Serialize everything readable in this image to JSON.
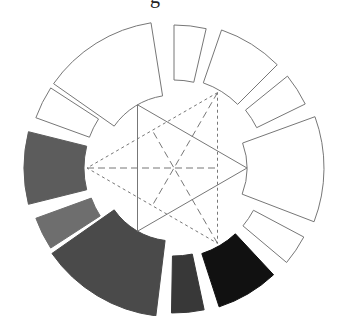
{
  "title_fragment": "g",
  "diagram": {
    "center": [
      174,
      168
    ],
    "stroke_color": "#777777",
    "segments": [
      {
        "name": "segment-top-narrow",
        "start": 77,
        "end": 90,
        "r_in": 88,
        "r_out": 143,
        "fill": "#ffffff"
      },
      {
        "name": "segment-upper-right",
        "start": 45,
        "end": 71,
        "r_in": 90,
        "r_out": 146,
        "fill": "#ffffff"
      },
      {
        "name": "segment-right-narrow",
        "start": 26,
        "end": 39,
        "r_in": 92,
        "r_out": 146,
        "fill": "#ffffff"
      },
      {
        "name": "segment-right-large",
        "start": -21,
        "end": 20,
        "r_in": 73,
        "r_out": 150,
        "fill": "#ffffff"
      },
      {
        "name": "segment-lower-right-narrow",
        "start": -40,
        "end": -28,
        "r_in": 90,
        "r_out": 147,
        "fill": "#ffffff"
      },
      {
        "name": "segment-black",
        "start": -72,
        "end": -47,
        "r_in": 90,
        "r_out": 146,
        "fill": "#111111"
      },
      {
        "name": "segment-bottom-narrow-dark",
        "start": -91,
        "end": -78,
        "r_in": 88,
        "r_out": 145,
        "fill": "#383838"
      },
      {
        "name": "segment-bottom-left-large",
        "start": -145,
        "end": -97,
        "r_in": 73,
        "r_out": 149,
        "fill": "#4a4a4a"
      },
      {
        "name": "segment-left-narrow-gray",
        "start": -160,
        "end": -147,
        "r_in": 88,
        "r_out": 147,
        "fill": "#6e6e6e"
      },
      {
        "name": "segment-left-gray",
        "start": 166,
        "end": 194,
        "r_in": 90,
        "r_out": 150,
        "fill": "#5c5c5c"
      },
      {
        "name": "segment-upper-left-narrow",
        "start": 147,
        "end": 160,
        "r_in": 90,
        "r_out": 147,
        "fill": "#ffffff"
      },
      {
        "name": "segment-top-left-large",
        "start": 99,
        "end": 145,
        "r_in": 73,
        "r_out": 147,
        "fill": "#ffffff"
      }
    ],
    "solid_triangle": {
      "radius": 73,
      "angles": [
        0,
        120,
        240
      ]
    },
    "dashed_triangle": {
      "radius": 87,
      "angles": [
        60,
        180,
        300
      ]
    }
  }
}
